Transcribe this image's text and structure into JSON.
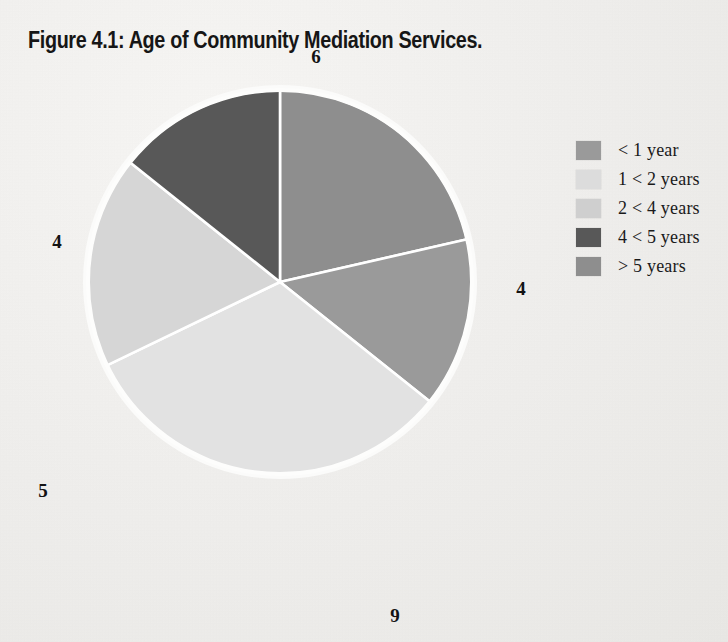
{
  "figure": {
    "title": "Figure 4.1:  Age of Community Mediation Services."
  },
  "legend": {
    "items": [
      {
        "label": "< 1 year",
        "color": "#9a9a9a"
      },
      {
        "label": "1 < 2 years",
        "color": "#dcdcdc"
      },
      {
        "label": "2 < 4 years",
        "color": "#cfcfcf"
      },
      {
        "label": "4 < 5 years",
        "color": "#585858"
      },
      {
        "label": "> 5 years",
        "color": "#8e8e8e"
      }
    ]
  },
  "labels": {
    "top": "6",
    "right": "4",
    "bottom": "9",
    "bottom_left": "5",
    "top_left": "4"
  },
  "chart_data": {
    "type": "pie",
    "title": "Figure 4.1:  Age of Community Mediation Services.",
    "categories": [
      "> 5 years",
      "< 1 year",
      "2 < 4 years",
      "1 < 2 years",
      "4 < 5 years"
    ],
    "values": [
      6,
      4,
      9,
      5,
      4
    ],
    "total": 28,
    "colors": [
      "#8e8e8e",
      "#9a9a9a",
      "#e2e2e2",
      "#d6d6d6",
      "#585858"
    ],
    "data_labels": [
      "6",
      "4",
      "9",
      "5",
      "4"
    ],
    "start_angle_deg": 0,
    "direction": "clockwise",
    "legend_position": "right",
    "slice_separator_color": "#ffffff",
    "xlabel": "",
    "ylabel": ""
  }
}
